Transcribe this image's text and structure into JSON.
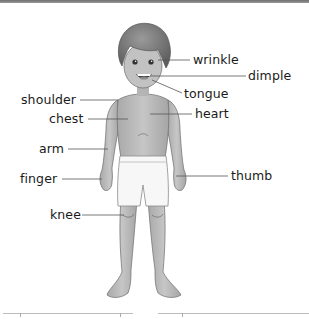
{
  "diagram": {
    "type": "labeled body parts illustration",
    "labels": [
      {
        "id": "wrinkle",
        "text": "wrinkle",
        "side": "right"
      },
      {
        "id": "dimple",
        "text": "dimple",
        "side": "right"
      },
      {
        "id": "tongue",
        "text": "tongue",
        "side": "right"
      },
      {
        "id": "shoulder",
        "text": "shoulder",
        "side": "left"
      },
      {
        "id": "chest",
        "text": "chest",
        "side": "left"
      },
      {
        "id": "heart",
        "text": "heart",
        "side": "right"
      },
      {
        "id": "arm",
        "text": "arm",
        "side": "left"
      },
      {
        "id": "finger",
        "text": "finger",
        "side": "left"
      },
      {
        "id": "thumb",
        "text": "thumb",
        "side": "right"
      },
      {
        "id": "knee",
        "text": "knee",
        "side": "left"
      }
    ]
  },
  "colors": {
    "skin": "#b9b9b9",
    "hair": "#7a7a7a",
    "shorts": "#f7f7f7",
    "line": "#555555",
    "text": "#1a1a1a"
  }
}
